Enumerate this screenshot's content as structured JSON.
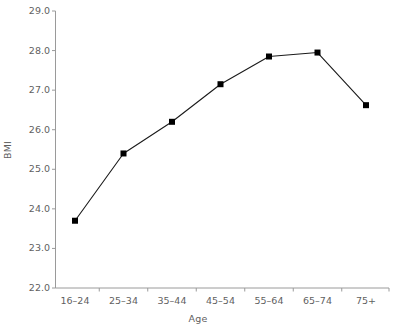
{
  "chart_data": {
    "type": "line",
    "title": "",
    "xlabel": "Age",
    "ylabel": "BMI",
    "categories": [
      "16–24",
      "25–34",
      "35–44",
      "45–54",
      "55–64",
      "65–74",
      "75+"
    ],
    "values": [
      23.7,
      25.4,
      26.2,
      27.15,
      27.85,
      27.95,
      26.62
    ],
    "series": [
      {
        "name": "BMI",
        "values": [
          23.7,
          25.4,
          26.2,
          27.15,
          27.85,
          27.95,
          26.62
        ]
      }
    ],
    "ylim": [
      22.0,
      29.0
    ],
    "ytick_labels": [
      "29.0",
      "28.0",
      "27.0",
      "26.0",
      "25.0",
      "24.0",
      "23.0",
      "22.0"
    ],
    "ytick_values": [
      29.0,
      28.0,
      27.0,
      26.0,
      25.0,
      24.0,
      23.0,
      22.0
    ],
    "grid": false,
    "legend": "none",
    "marker": "square",
    "line_color": "#1a1a1a",
    "marker_color": "#000000",
    "axis_color": "#9a9a9a",
    "label_color": "#5f5f5f"
  }
}
